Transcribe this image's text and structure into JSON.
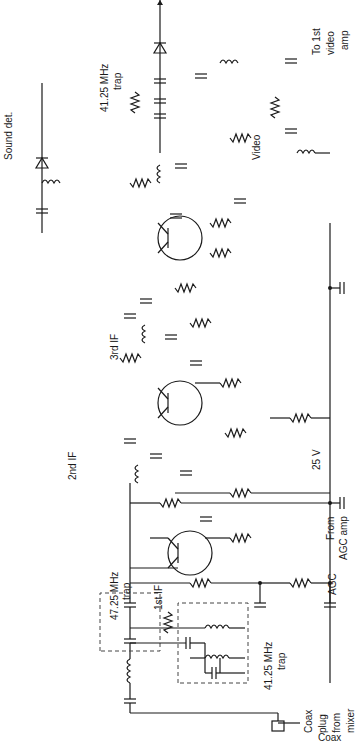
{
  "orientation": "rotated 90 degrees counter-clockwise; signal flows bottom to top",
  "stages": [
    {
      "id": "Q1",
      "label": "1st IF",
      "ref": "Q",
      "sub": "1"
    },
    {
      "id": "Q2",
      "label": "2nd IF",
      "ref": "Q",
      "sub": "2"
    },
    {
      "id": "Q3",
      "label": "3rd IF",
      "ref": "Q",
      "sub": "3"
    }
  ],
  "labels": {
    "input": [
      "Coax",
      "plug",
      "from",
      "mixer"
    ],
    "output": [
      "To 1st",
      "video",
      "amp"
    ],
    "agc": "AGC",
    "agc_source": [
      "From",
      "AGC amp"
    ],
    "supply": "25 V",
    "sound_det": "Sound det.",
    "video_det": [
      "Video",
      "det."
    ],
    "trap_4725": [
      "47.25 MHz",
      "trap"
    ],
    "trap_4125_in": [
      "41.25 MHz",
      "trap"
    ],
    "trap_4125_out": [
      "41.25 MHz",
      "trap"
    ]
  },
  "components": {
    "CA1": {
      "ref": "CA",
      "sub": "1"
    },
    "LA2": {
      "ref": "LA",
      "sub": "2"
    },
    "CA3": {
      "ref": "CA",
      "sub": "3",
      "value": "10 pF"
    },
    "CA4": {
      "ref": "CA",
      "sub": "4",
      "value": "10 pF"
    },
    "RA6": {
      "ref": "RA",
      "sub": "6",
      "value": "4.7"
    },
    "CA7": {
      "ref": "CA",
      "sub": "7"
    },
    "LA8": {
      "ref": "LA",
      "sub": "8"
    },
    "LA9": {
      "ref": "LA",
      "sub": "9"
    },
    "RA10": {
      "ref": "RA",
      "sub": "10"
    },
    "CA11": {
      "ref": "CA",
      "sub": "11"
    },
    "RA12": {
      "ref": "RA",
      "sub": "12"
    },
    "RA13": {
      "ref": "RA",
      "sub": "13"
    },
    "CA14": {
      "ref": "CA",
      "sub": "14"
    },
    "RA16": {
      "ref": "RA",
      "sub": "16"
    },
    "RA17": {
      "ref": "RA",
      "sub": "17"
    },
    "CA18": {
      "ref": "CA",
      "sub": "18"
    },
    "LA20": {
      "ref": "LA",
      "sub": "20"
    },
    "CA21": {
      "ref": "CA",
      "sub": "21",
      "value": "33 pF"
    },
    "CA22": {
      "ref": "CA",
      "sub": "22",
      "value": "100 pF"
    },
    "RA23": {
      "ref": "RA",
      "sub": "23"
    },
    "RA25": {
      "ref": "RA",
      "sub": "25"
    },
    "CA26": {
      "ref": "CA",
      "sub": "26"
    },
    "RA27": {
      "ref": "RA",
      "sub": "27"
    },
    "LA28": {
      "ref": "LA",
      "sub": "28"
    },
    "CA29": {
      "ref": "CA",
      "sub": "29",
      "value": "27 pF"
    },
    "CA30": {
      "ref": "CA",
      "sub": "30"
    },
    "CA31": {
      "ref": "CA",
      "sub": "31",
      "value": "100 pF"
    },
    "RA32": {
      "ref": "RA",
      "sub": "32"
    },
    "RA33": {
      "ref": "RA",
      "sub": "33"
    },
    "RA34": {
      "ref": "RA",
      "sub": "34"
    },
    "RA35": {
      "ref": "RA",
      "sub": "35"
    },
    "CA36": {
      "ref": "CA",
      "sub": "36"
    },
    "CA37": {
      "ref": "CA",
      "sub": "37"
    },
    "RA38": {
      "ref": "RA",
      "sub": "38"
    },
    "LA39": {
      "ref": "LA",
      "sub": "39"
    },
    "CA40": {
      "ref": "CA",
      "sub": "40"
    },
    "CA41": {
      "ref": "CA",
      "sub": "41",
      "value": "1.0 pF"
    },
    "LA42": {
      "ref": "LA",
      "sub": "42"
    },
    "CRA43": {
      "ref": "CRA",
      "sub": "43"
    },
    "CA47": {
      "ref": "CA",
      "sub": "47",
      "value": "10 pF"
    },
    "RA48": {
      "ref": "RA",
      "sub": "48"
    },
    "CA50": {
      "ref": "CA",
      "sub": "50",
      "value": "10 pF"
    },
    "CA51": {
      "ref": "CA",
      "sub": "51",
      "value": "180 pF"
    },
    "CA52": {
      "ref": "CA",
      "sub": "52"
    },
    "CA53": {
      "ref": "CA",
      "sub": "53"
    },
    "LA54": {
      "ref": "LA",
      "sub": "54"
    },
    "CRA55": {
      "ref": "CRA",
      "sub": "55"
    },
    "RA67": {
      "ref": "RA",
      "sub": "67"
    },
    "RA68": {
      "ref": "RA",
      "sub": "68"
    },
    "CA69": {
      "ref": "CA",
      "sub": "69",
      "value": "0.01"
    },
    "CA70": {
      "ref": "CA",
      "sub": "70",
      "value": "0.1"
    },
    "RA71": {
      "ref": "RA",
      "sub": "71",
      "value": "10"
    },
    "CA72": {
      "ref": "CA",
      "sub": "72"
    },
    "CA73": {
      "ref": "CA",
      "sub": "73"
    },
    "LA76": {
      "ref": "LA",
      "sub": "76",
      "value": "12 µH"
    },
    "CA79": {
      "ref": "CA",
      "sub": "79",
      "value": "0.01"
    }
  }
}
